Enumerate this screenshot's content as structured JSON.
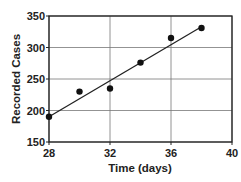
{
  "chart_data": {
    "type": "scatter",
    "title": "",
    "xlabel": "Time (days)",
    "ylabel": "Recorded Cases",
    "xlim": [
      28,
      40
    ],
    "ylim": [
      150,
      350
    ],
    "xticks": [
      28,
      32,
      36,
      40
    ],
    "yticks": [
      150,
      200,
      250,
      300,
      350
    ],
    "grid": true,
    "legend": null,
    "series": [
      {
        "name": "Recorded Cases",
        "type": "scatter",
        "x": [
          28,
          30,
          32,
          34,
          36,
          38
        ],
        "y": [
          190,
          230,
          235,
          276,
          315,
          331
        ]
      },
      {
        "name": "Best-fit line",
        "type": "line",
        "x": [
          28,
          38
        ],
        "y": [
          190,
          333
        ]
      }
    ],
    "colors": {
      "points": "#111111",
      "line": "#222222",
      "grid": "#777777",
      "frame": "#222222"
    }
  }
}
